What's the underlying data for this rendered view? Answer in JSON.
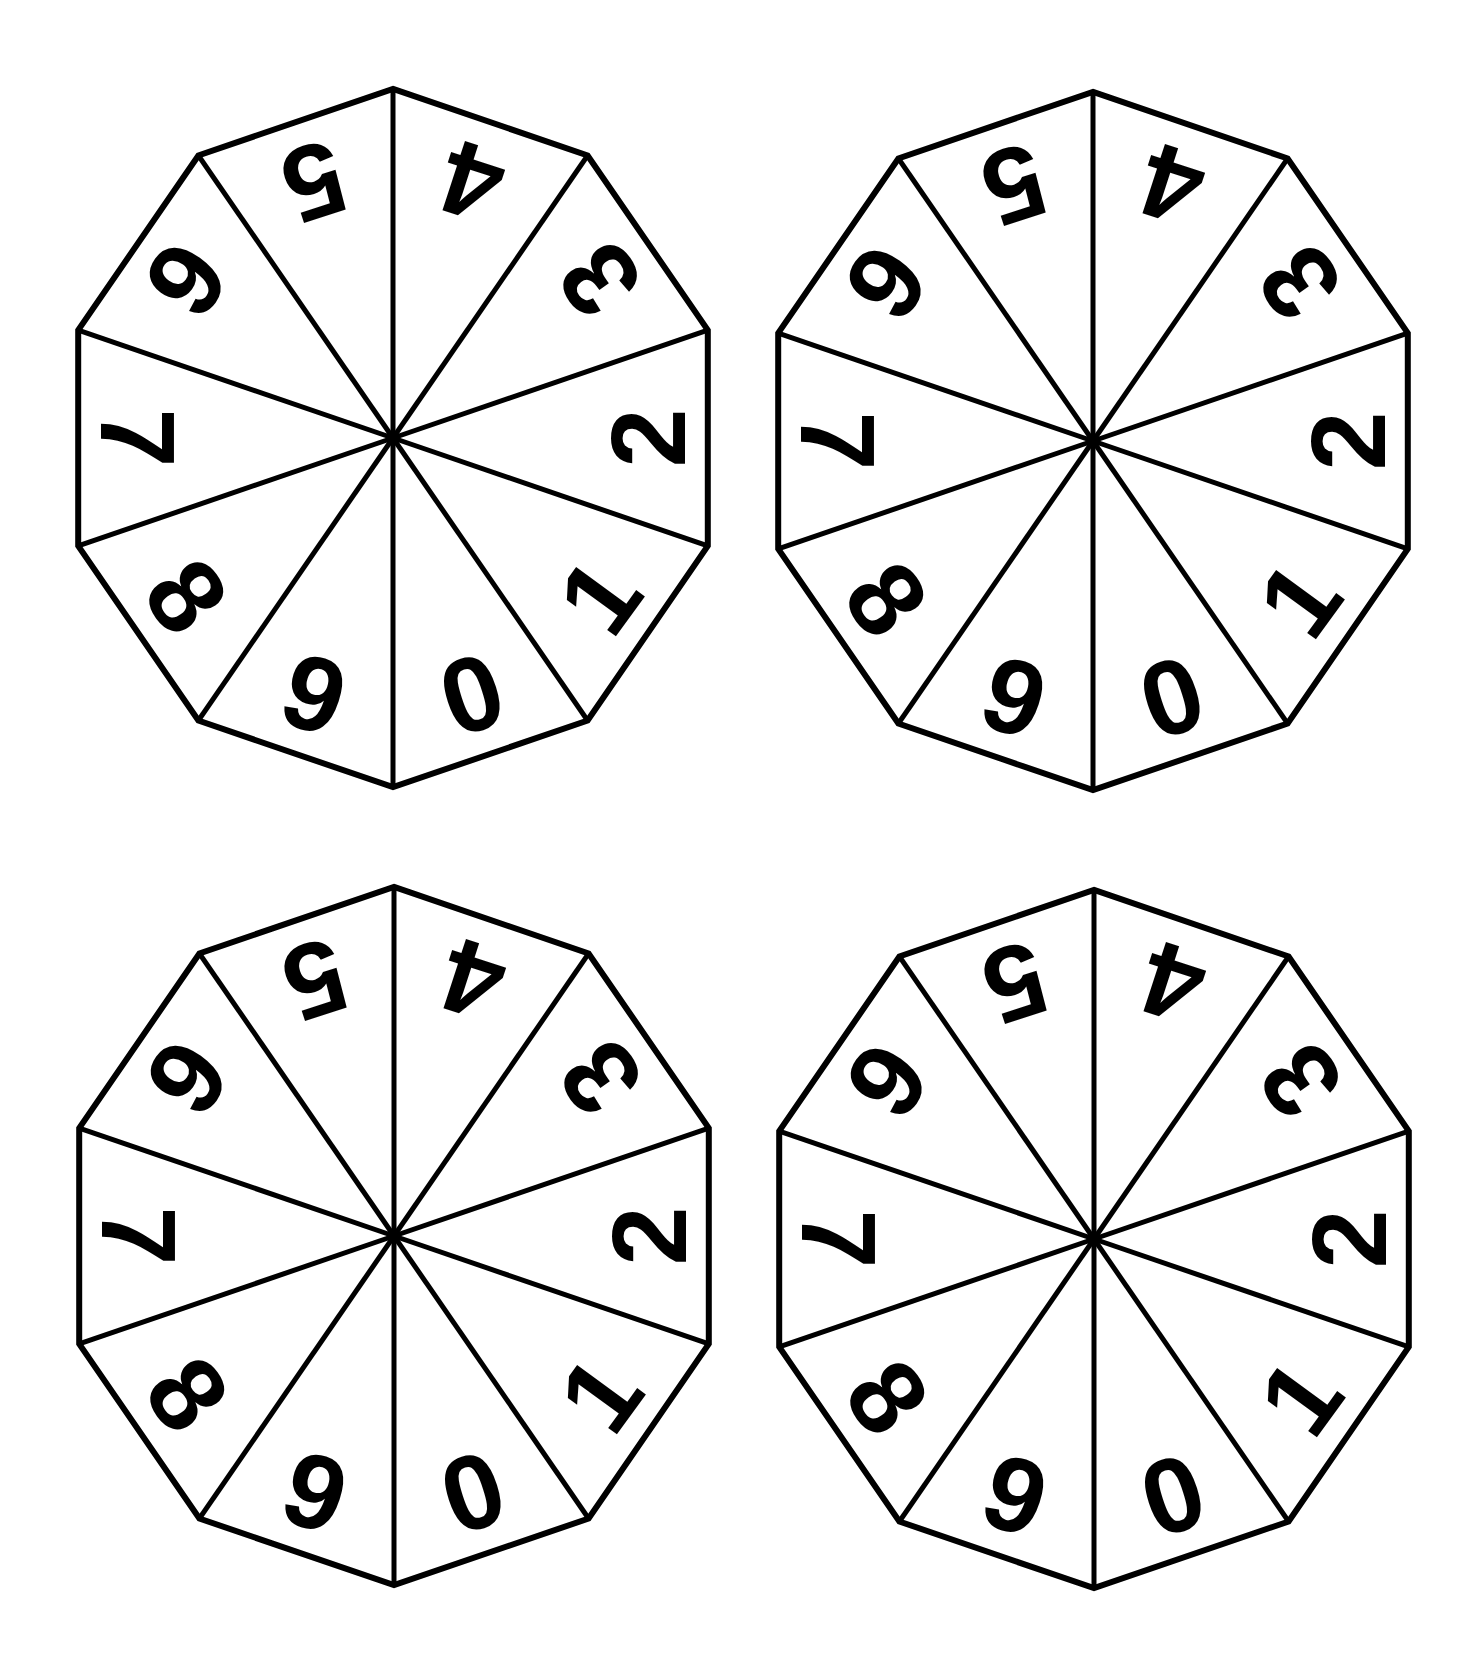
{
  "page": {
    "title": "NUMBERS 0-9"
  },
  "spinner_style": {
    "shape": "decagon",
    "sides": 10,
    "stroke_color": "#000000",
    "fill_color": "#ffffff",
    "digit_color": "#000000"
  },
  "spinners": [
    {
      "id": "top-left",
      "cx": 393,
      "cy": 438,
      "segments": [
        "4",
        "3",
        "2",
        "1",
        "0",
        "9",
        "8",
        "7",
        "6",
        "5"
      ]
    },
    {
      "id": "top-right",
      "cx": 1093,
      "cy": 441,
      "segments": [
        "4",
        "3",
        "2",
        "1",
        "0",
        "9",
        "8",
        "7",
        "6",
        "5"
      ]
    },
    {
      "id": "bottom-left",
      "cx": 394,
      "cy": 1236,
      "segments": [
        "4",
        "3",
        "2",
        "1",
        "0",
        "9",
        "8",
        "7",
        "6",
        "5"
      ]
    },
    {
      "id": "bottom-right",
      "cx": 1094,
      "cy": 1239,
      "segments": [
        "4",
        "3",
        "2",
        "1",
        "0",
        "9",
        "8",
        "7",
        "6",
        "5"
      ]
    }
  ]
}
